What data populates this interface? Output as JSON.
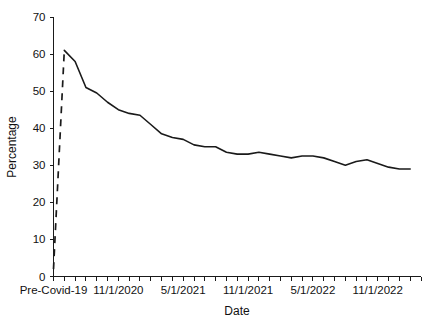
{
  "chart_data": {
    "type": "line",
    "title": "",
    "xlabel": "Date",
    "ylabel": "Percentage",
    "ylim": [
      0,
      70
    ],
    "ytick_step": 10,
    "yticks": [
      "0",
      "10",
      "20",
      "30",
      "40",
      "50",
      "60",
      "70"
    ],
    "grid": false,
    "legend": null,
    "xtick_labels": [
      "Pre-Covid-19",
      "11/1/2020",
      "5/1/2021",
      "11/1/2021",
      "5/1/2022",
      "11/1/2022"
    ],
    "xtick_label_indices": [
      0,
      6,
      12,
      18,
      24,
      30
    ],
    "minor_tick_count": 34,
    "x": [
      "Pre-Covid-19",
      "5/1/2020",
      "6/1/2020",
      "7/1/2020",
      "8/1/2020",
      "9/1/2020",
      "10/1/2020",
      "11/1/2020",
      "12/1/2020",
      "1/1/2021",
      "2/1/2021",
      "3/1/2021",
      "4/1/2021",
      "5/1/2021",
      "6/1/2021",
      "7/1/2021",
      "8/1/2021",
      "9/1/2021",
      "10/1/2021",
      "11/1/2021",
      "12/1/2021",
      "1/1/2022",
      "2/1/2022",
      "3/1/2022",
      "4/1/2022",
      "5/1/2022",
      "6/1/2022",
      "7/1/2022",
      "8/1/2022",
      "9/1/2022",
      "10/1/2022",
      "11/1/2022",
      "12/1/2022"
    ],
    "series": [
      {
        "name": "Pre-Covid-19 jump",
        "style": "dashed",
        "color": "#1a1a1a",
        "points": [
          {
            "x": "Pre-Covid-19",
            "y": 2.0
          },
          {
            "x": "4/1/2020",
            "y": 61.0
          }
        ]
      },
      {
        "name": "Percentage",
        "style": "solid",
        "color": "#1a1a1a",
        "values": [
          61.0,
          58.0,
          51.0,
          49.5,
          47.0,
          45.0,
          44.0,
          43.5,
          41.0,
          38.5,
          37.5,
          37.0,
          35.5,
          35.0,
          35.0,
          33.5,
          33.0,
          33.0,
          33.5,
          33.0,
          32.5,
          32.0,
          32.5,
          32.5,
          32.0,
          31.0,
          30.0,
          31.0,
          31.5,
          30.5,
          29.5,
          29.0,
          29.0
        ]
      }
    ]
  },
  "axis": {
    "x_title": "Date",
    "y_title": "Percentage"
  }
}
